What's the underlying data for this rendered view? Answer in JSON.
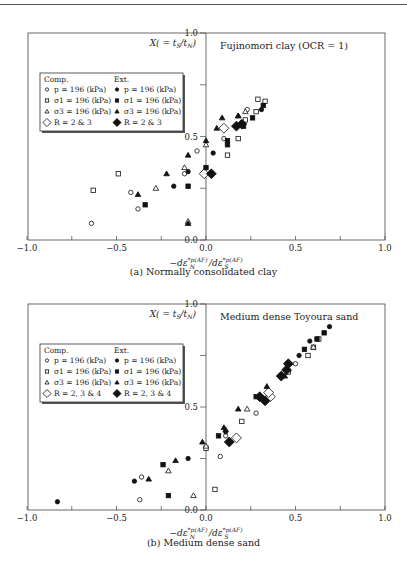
{
  "chart_data": [
    {
      "type": "scatter",
      "panel": "a",
      "title": "Fujinomori clay (OCR = 1)",
      "caption": "(a) Normally consolidated clay",
      "xlabel": "−dε*p(AF)_N / dε*p(AF)_S",
      "ylabel": "X( = t_S/t_N)",
      "xlim": [
        -1.0,
        1.0
      ],
      "ylim": [
        0.0,
        1.0
      ],
      "xticks": [
        "−1.0",
        "−0.5",
        "0.0",
        "0.5",
        "1.0"
      ],
      "yticks": [
        "0.0",
        "0.5",
        "1.0"
      ],
      "grid": false,
      "legend": {
        "position": "upper-left",
        "headers": [
          "Comp.",
          "Ext."
        ],
        "entries": [
          {
            "marker": "circle-open",
            "label": "p = 196 (kPa)"
          },
          {
            "marker": "square-open",
            "label": "σ1 = 196 (kPa)"
          },
          {
            "marker": "triangle-open",
            "label": "σ3 = 196 (kPa)"
          },
          {
            "marker": "diamond-open",
            "label": "R = 2 & 3"
          },
          {
            "marker": "circle-filled",
            "label": "p = 196 (kPa)"
          },
          {
            "marker": "square-filled",
            "label": "σ1 = 196 (kPa)"
          },
          {
            "marker": "triangle-filled",
            "label": "σ3 = 196 (kPa)"
          },
          {
            "marker": "diamond-filled",
            "label": "R = 2 & 3"
          }
        ]
      },
      "series": [
        {
          "name": "Comp. p = 196 (kPa)",
          "marker": "circle-open",
          "points": [
            [
              -0.64,
              0.08
            ],
            [
              -0.42,
              0.23
            ],
            [
              -0.38,
              0.15
            ],
            [
              -0.12,
              0.32
            ],
            [
              -0.05,
              0.43
            ],
            [
              0.1,
              0.49
            ],
            [
              0.23,
              0.63
            ]
          ]
        },
        {
          "name": "Comp. σ1 = 196 (kPa)",
          "marker": "square-open",
          "points": [
            [
              -0.63,
              0.24
            ],
            [
              -0.49,
              0.32
            ],
            [
              0.12,
              0.41
            ],
            [
              0.18,
              0.49
            ],
            [
              0.22,
              0.58
            ],
            [
              0.28,
              0.62
            ],
            [
              0.29,
              0.68
            ],
            [
              0.33,
              0.67
            ]
          ]
        },
        {
          "name": "Comp. σ3 = 196 (kPa)",
          "marker": "triangle-open",
          "points": [
            [
              -0.28,
              0.25
            ],
            [
              -0.12,
              0.35
            ],
            [
              0.0,
              0.46
            ],
            [
              -0.1,
              0.09
            ],
            [
              0.18,
              0.6
            ],
            [
              0.22,
              0.62
            ]
          ]
        },
        {
          "name": "Comp. R = 2 & 3",
          "marker": "diamond-open",
          "points": [
            [
              -0.01,
              0.32
            ],
            [
              0.1,
              0.54
            ]
          ]
        },
        {
          "name": "Ext. p = 196 (kPa)",
          "marker": "circle-filled",
          "points": [
            [
              -0.18,
              0.26
            ],
            [
              -0.1,
              0.33
            ],
            [
              0.04,
              0.42
            ],
            [
              0.31,
              0.63
            ]
          ]
        },
        {
          "name": "Ext. σ1 = 196 (kPa)",
          "marker": "square-filled",
          "points": [
            [
              -0.34,
              0.17
            ],
            [
              -0.1,
              0.26
            ],
            [
              0.0,
              0.35
            ],
            [
              0.12,
              0.46
            ],
            [
              0.12,
              0.48
            ],
            [
              0.21,
              0.55
            ],
            [
              0.26,
              0.59
            ],
            [
              0.32,
              0.65
            ]
          ]
        },
        {
          "name": "Ext. σ3 = 196 (kPa)",
          "marker": "triangle-filled",
          "points": [
            [
              -0.38,
              0.22
            ],
            [
              -0.22,
              0.32
            ],
            [
              -0.1,
              0.41
            ],
            [
              0.0,
              0.48
            ],
            [
              0.06,
              0.54
            ],
            [
              0.09,
              0.59
            ],
            [
              0.18,
              0.6
            ],
            [
              -0.1,
              0.08
            ]
          ]
        },
        {
          "name": "Ext. R = 2 & 3",
          "marker": "diamond-filled",
          "points": [
            [
              0.03,
              0.32
            ],
            [
              0.17,
              0.55
            ],
            [
              0.2,
              0.56
            ]
          ]
        }
      ]
    },
    {
      "type": "scatter",
      "panel": "b",
      "title": "Medium dense Toyoura sand",
      "caption": "(b) Medium dense sand",
      "xlabel": "−dε*p(AF)_N / dε*p(AF)_S",
      "ylabel": "X( = t_S/t_N)",
      "xlim": [
        -1.0,
        1.0
      ],
      "ylim": [
        0.0,
        1.0
      ],
      "xticks": [
        "−1.0",
        "−0.5",
        "0.0",
        "0.5",
        "1.0"
      ],
      "yticks": [
        "0.0",
        "0.5",
        "1.0"
      ],
      "grid": false,
      "legend": {
        "position": "upper-left",
        "headers": [
          "Comp.",
          "Ext."
        ],
        "entries": [
          {
            "marker": "circle-open",
            "label": "p = 196 (kPa)"
          },
          {
            "marker": "square-open",
            "label": "σ1 = 196 (kPa)"
          },
          {
            "marker": "triangle-open",
            "label": "σ3 = 196 (kPa)"
          },
          {
            "marker": "diamond-open",
            "label": "R = 2, 3 & 4"
          },
          {
            "marker": "circle-filled",
            "label": "p = 196 (kPa)"
          },
          {
            "marker": "square-filled",
            "label": "σ1 = 196 (kPa)"
          },
          {
            "marker": "triangle-filled",
            "label": "σ3 = 196 (kPa)"
          },
          {
            "marker": "diamond-filled",
            "label": "R = 2, 3 & 4"
          }
        ]
      },
      "series": [
        {
          "name": "Comp. p = 196 (kPa)",
          "marker": "circle-open",
          "points": [
            [
              -0.37,
              0.05
            ],
            [
              -0.36,
              0.16
            ],
            [
              0.08,
              0.26
            ],
            [
              0.11,
              0.36
            ],
            [
              0.28,
              0.47
            ],
            [
              0.5,
              0.71
            ]
          ]
        },
        {
          "name": "Comp. σ1 = 196 (kPa)",
          "marker": "square-open",
          "points": [
            [
              0.05,
              0.1
            ],
            [
              0.0,
              0.3
            ],
            [
              0.2,
              0.43
            ],
            [
              0.46,
              0.67
            ],
            [
              0.57,
              0.75
            ],
            [
              0.6,
              0.79
            ],
            [
              0.63,
              0.83
            ]
          ]
        },
        {
          "name": "Comp. σ3 = 196 (kPa)",
          "marker": "triangle-open",
          "points": [
            [
              -0.07,
              0.07
            ],
            [
              -0.21,
              0.19
            ],
            [
              0.0,
              0.31
            ],
            [
              0.11,
              0.39
            ],
            [
              0.23,
              0.49
            ],
            [
              0.6,
              0.79
            ]
          ]
        },
        {
          "name": "Comp. R = 2, 3 & 4",
          "marker": "diamond-open",
          "points": [
            [
              0.17,
              0.35
            ],
            [
              0.36,
              0.55
            ],
            [
              0.35,
              0.57
            ]
          ]
        },
        {
          "name": "Ext. p = 196 (kPa)",
          "marker": "circle-filled",
          "points": [
            [
              -0.83,
              0.04
            ],
            [
              -0.4,
              0.14
            ],
            [
              -0.1,
              0.25
            ],
            [
              0.11,
              0.38
            ],
            [
              0.52,
              0.75
            ],
            [
              0.58,
              0.82
            ],
            [
              0.69,
              0.89
            ]
          ]
        },
        {
          "name": "Ext. σ1 = 196 (kPa)",
          "marker": "square-filled",
          "points": [
            [
              -0.21,
              0.07
            ],
            [
              -0.24,
              0.22
            ],
            [
              0.07,
              0.36
            ],
            [
              0.28,
              0.55
            ],
            [
              0.55,
              0.78
            ],
            [
              0.62,
              0.83
            ],
            [
              0.66,
              0.86
            ]
          ]
        },
        {
          "name": "Ext. σ3 = 196 (kPa)",
          "marker": "triangle-filled",
          "points": [
            [
              -0.32,
              0.15
            ],
            [
              -0.17,
              0.24
            ],
            [
              -0.02,
              0.33
            ],
            [
              0.1,
              0.4
            ],
            [
              0.18,
              0.49
            ],
            [
              0.34,
              0.6
            ],
            [
              0.44,
              0.65
            ]
          ]
        },
        {
          "name": "Ext. R = 2, 3 & 4",
          "marker": "diamond-filled",
          "points": [
            [
              0.13,
              0.33
            ],
            [
              0.3,
              0.55
            ],
            [
              0.33,
              0.53
            ],
            [
              0.42,
              0.65
            ],
            [
              0.45,
              0.68
            ],
            [
              0.46,
              0.71
            ]
          ]
        }
      ]
    }
  ]
}
